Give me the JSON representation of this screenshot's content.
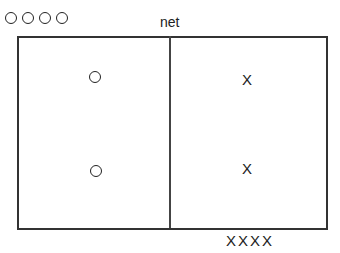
{
  "diagram": {
    "net_label": "net",
    "court": {
      "sides": [
        "left",
        "right"
      ]
    },
    "left_side": {
      "players": [
        "O",
        "O"
      ]
    },
    "right_side": {
      "players": [
        "X",
        "X"
      ]
    },
    "bench_top": {
      "team": "O",
      "count": 4,
      "glyphs": "OOOO"
    },
    "bench_bottom": {
      "team": "X",
      "count": 4,
      "glyphs": "XXXX"
    }
  }
}
